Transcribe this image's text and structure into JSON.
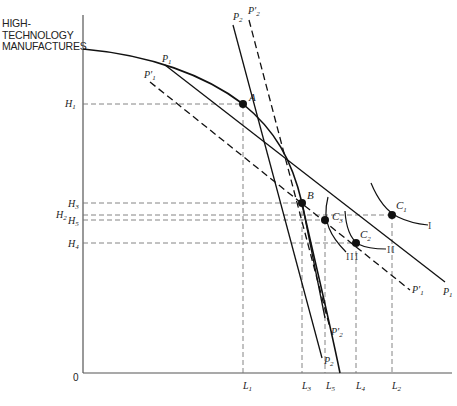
{
  "axis": {
    "y_title_lines": [
      "HIGH-",
      "TECHNOLOGY",
      "MANUFACTURES"
    ],
    "origin": "0"
  },
  "y_ticks": {
    "H1": {
      "main": "H",
      "sub": "1"
    },
    "H3": {
      "main": "H",
      "sub": "3"
    },
    "H2": {
      "main": "H",
      "sub": "2"
    },
    "H5": {
      "main": "H",
      "sub": "5"
    },
    "H4": {
      "main": "H",
      "sub": "4"
    }
  },
  "x_ticks": {
    "L1": {
      "main": "L",
      "sub": "1"
    },
    "L3": {
      "main": "L",
      "sub": "3"
    },
    "L5": {
      "main": "L",
      "sub": "5"
    },
    "L4": {
      "main": "L",
      "sub": "4"
    },
    "L2": {
      "main": "L",
      "sub": "2"
    }
  },
  "points": {
    "A": {
      "main": "A",
      "sub": ""
    },
    "B": {
      "main": "B",
      "sub": ""
    },
    "C1": {
      "main": "C",
      "sub": "1"
    },
    "C2": {
      "main": "C",
      "sub": "2"
    },
    "C3": {
      "main": "C",
      "sub": "3"
    }
  },
  "price_lines": {
    "P1_top": {
      "main": "P",
      "sub": "1"
    },
    "P1_end": {
      "main": "P",
      "sub": "1"
    },
    "P1p_top": {
      "main": "P'",
      "sub": "1"
    },
    "P1p_end": {
      "main": "P'",
      "sub": "1"
    },
    "P2_top": {
      "main": "P",
      "sub": "2"
    },
    "P2_end": {
      "main": "P",
      "sub": "2"
    },
    "P2p_top": {
      "main": "P'",
      "sub": "2"
    },
    "P2p_end": {
      "main": "P'",
      "sub": "2"
    }
  },
  "indifference_curves": {
    "I": "I",
    "II": "II",
    "III": "III"
  }
}
